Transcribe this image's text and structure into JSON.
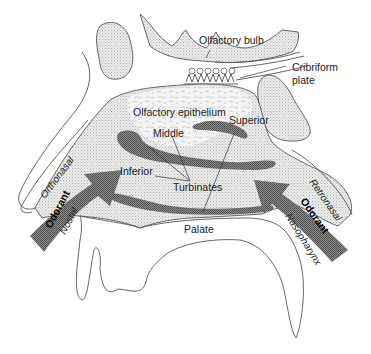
{
  "diagram": {
    "labels": {
      "olfactory_bulb": "Olfactory bulb",
      "cribriform_plate_1": "Cribriform",
      "cribriform_plate_2": "plate",
      "olfactory_epithelium": "Olfactory epithelium",
      "superior": "Superior",
      "middle": "Middle",
      "inferior": "Inferior",
      "turbinates": "Turbinates",
      "orthonasal": "Orthonasal",
      "nostril": "Nostril",
      "odorant_left": "Odorant",
      "retronasal": "Retronasal",
      "odorant_right": "Odorant",
      "nasopharynx": "Nasopharynx",
      "palate": "Palate"
    },
    "colors": {
      "outline": "#555555",
      "dark_fill": "#6e6e6e",
      "light_fill": "#d9d9d9",
      "text": "#222222"
    }
  }
}
